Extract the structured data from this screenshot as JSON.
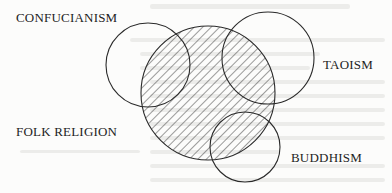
{
  "diagram": {
    "type": "venn",
    "labels": {
      "confucianism": "CONFUCIANISM",
      "taoism": "TAOISM",
      "folk_religion": "FOLK RELIGION",
      "buddhism": "BUDDHISM"
    },
    "circles": [
      {
        "name": "Confucianism",
        "cx": 148,
        "cy": 65,
        "r": 42,
        "hatched": false
      },
      {
        "name": "Folk Religion",
        "cx": 208,
        "cy": 93,
        "r": 67,
        "hatched": true
      },
      {
        "name": "Taoism",
        "cx": 268,
        "cy": 58,
        "r": 46,
        "hatched": false
      },
      {
        "name": "Buddhism",
        "cx": 245,
        "cy": 147,
        "r": 35,
        "hatched": false
      }
    ],
    "colors": {
      "stroke": "#2a2a2a",
      "hatch": "#3a3a3a",
      "text": "#1e1e1e",
      "paper": "#fcfcfb",
      "bleed_through": "#e6e6e4"
    }
  }
}
